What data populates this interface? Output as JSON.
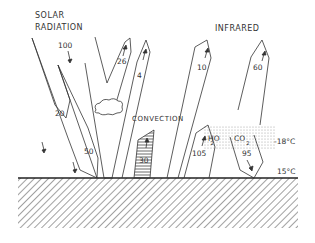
{
  "labels": {
    "solar_line1": "SOLAR",
    "solar_line2": "RADIATION",
    "infrared": "INFRARED",
    "convection": "CONVECTION",
    "h2o_h": "HO",
    "h2o_sub": "2",
    "co2_c": "CO",
    "co2_sub": "2",
    "temp_atmosphere": "-18°C",
    "temp_surface": "15°C"
  },
  "flows": {
    "solar_incoming": "100",
    "solar_reflected_clouds": "26",
    "solar_reflected_surface": "4",
    "solar_absorbed_atmosphere": "20",
    "solar_absorbed_surface": "50",
    "convection": "30",
    "infrared_surface_escape": "10",
    "infrared_atmosphere_emission": "60",
    "infrared_surface_emission": "105",
    "infrared_back_radiation": "95"
  },
  "colors": {
    "line": "#333333",
    "stipple": "#bbbbbb",
    "background": "#ffffff"
  }
}
